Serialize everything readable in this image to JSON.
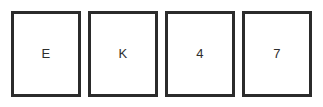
{
  "task": {
    "background_color": "#ffffff",
    "card_border_color": "#2b2b2b",
    "card_face_color": "#ffffff",
    "text_color": "#2e2e2e"
  },
  "cards": [
    {
      "face": "E",
      "kind": "letter"
    },
    {
      "face": "K",
      "kind": "letter"
    },
    {
      "face": "4",
      "kind": "number"
    },
    {
      "face": "7",
      "kind": "number"
    }
  ]
}
